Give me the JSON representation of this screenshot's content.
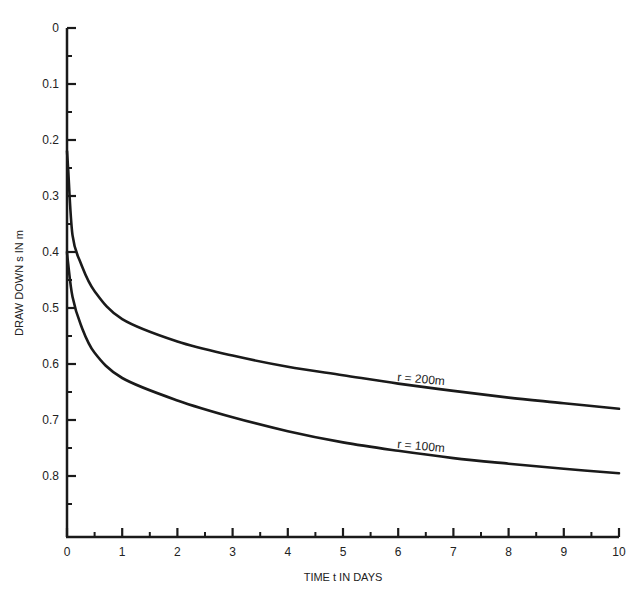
{
  "chart_data": {
    "type": "line",
    "title": "",
    "xlabel": "TIME t IN DAYS",
    "ylabel": "DRAW DOWN s IN m",
    "xlim": [
      0,
      10
    ],
    "ylim": [
      0,
      0.9
    ],
    "y_inverted": true,
    "grid": false,
    "legend": "inline curve labels",
    "x_ticks": [
      "0",
      "1",
      "2",
      "3",
      "4",
      "5",
      "6",
      "7",
      "8",
      "9",
      "10"
    ],
    "y_ticks": [
      "0",
      "0.1",
      "0.2",
      "0.3",
      "0.4",
      "0.5",
      "0.6",
      "0.7",
      "0.8"
    ],
    "series": [
      {
        "name": "r = 200m",
        "x": [
          0.02,
          0.1,
          0.25,
          0.5,
          1,
          2,
          3,
          4,
          5,
          6,
          7,
          8,
          9,
          10
        ],
        "values": [
          0.25,
          0.37,
          0.42,
          0.47,
          0.52,
          0.56,
          0.585,
          0.605,
          0.62,
          0.635,
          0.648,
          0.66,
          0.67,
          0.68
        ]
      },
      {
        "name": "r = 100m",
        "x": [
          0.02,
          0.1,
          0.25,
          0.5,
          1,
          2,
          3,
          4,
          5,
          6,
          7,
          8,
          9,
          10
        ],
        "values": [
          0.42,
          0.48,
          0.53,
          0.58,
          0.625,
          0.665,
          0.695,
          0.72,
          0.74,
          0.755,
          0.768,
          0.778,
          0.787,
          0.795
        ]
      }
    ],
    "annotations": [
      {
        "text": "r = 200m",
        "near_x": 6.5,
        "near_y": 0.63
      },
      {
        "text": "r = 100m",
        "near_x": 6.5,
        "near_y": 0.75
      }
    ]
  },
  "colors": {
    "line": "#1a1a1a",
    "background": "#ffffff"
  }
}
